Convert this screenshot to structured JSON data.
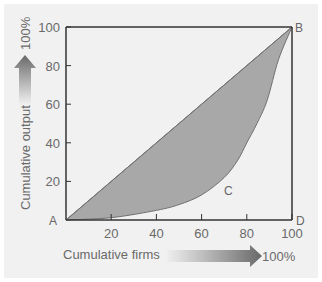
{
  "chart_data": {
    "type": "area",
    "title": "",
    "xlabel": "Cumulative firms",
    "ylabel": "Cumulative output",
    "x_arrow_label": "100%",
    "y_arrow_label": "100%",
    "xlim": [
      0,
      100
    ],
    "ylim": [
      0,
      100
    ],
    "x_ticks": [
      "20",
      "40",
      "60",
      "80",
      "100"
    ],
    "y_ticks": [
      "20",
      "40",
      "60",
      "80",
      "100"
    ],
    "grid": false,
    "point_labels": {
      "A": "A",
      "B": "B",
      "C": "C",
      "D": "D"
    },
    "series": [
      {
        "name": "Line of equality (AB)",
        "x": [
          0,
          100
        ],
        "y": [
          0,
          100
        ]
      },
      {
        "name": "Concentration curve (ACB)",
        "x": [
          0,
          20,
          40,
          50,
          60,
          70,
          76,
          80,
          84.5,
          89,
          94,
          100
        ],
        "y": [
          0,
          1.2,
          5,
          8,
          13,
          22,
          31,
          40,
          50,
          62,
          83,
          100
        ]
      }
    ],
    "shaded_region": "Area between line AB and curve ACB",
    "colors": {
      "shade": "#a8a8a8",
      "axis": "#333333",
      "background": "#f1f1f1"
    }
  }
}
